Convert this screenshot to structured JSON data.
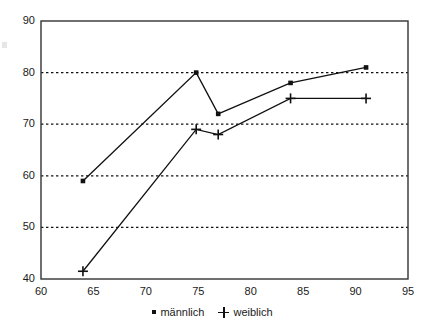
{
  "chart_data": {
    "type": "line",
    "title": "",
    "subtitle": "",
    "xlabel": "",
    "ylabel": "",
    "xlim": [
      60,
      95
    ],
    "ylim": [
      40,
      90
    ],
    "xticks": [
      60,
      65,
      70,
      75,
      80,
      85,
      90,
      95
    ],
    "yticks": [
      40,
      50,
      60,
      70,
      80,
      90
    ],
    "grid": {
      "horizontal": true,
      "vertical": false,
      "style": "dotted",
      "at": [
        50,
        60,
        70,
        80
      ]
    },
    "legend": {
      "position": "bottom-center"
    },
    "series": [
      {
        "name": "männlich",
        "marker": "square",
        "color": "#111111",
        "points": [
          {
            "x": 64.0,
            "y": 59
          },
          {
            "x": 74.8,
            "y": 80
          },
          {
            "x": 76.9,
            "y": 72
          },
          {
            "x": 83.8,
            "y": 78
          },
          {
            "x": 91.0,
            "y": 81
          }
        ]
      },
      {
        "name": "weiblich",
        "marker": "plus",
        "color": "#111111",
        "points": [
          {
            "x": 64.0,
            "y": 41.5
          },
          {
            "x": 74.8,
            "y": 69
          },
          {
            "x": 76.9,
            "y": 68
          },
          {
            "x": 83.8,
            "y": 75
          },
          {
            "x": 91.0,
            "y": 75
          }
        ]
      }
    ]
  },
  "axes": {
    "y_tick_labels": [
      "90",
      "80",
      "70",
      "60",
      "50",
      "40"
    ],
    "x_tick_labels": [
      "60",
      "65",
      "70",
      "75",
      "80",
      "85",
      "90",
      "95"
    ]
  },
  "legend": {
    "items": [
      {
        "label": "männlich",
        "marker": "square"
      },
      {
        "label": "weiblich",
        "marker": "plus"
      }
    ]
  }
}
